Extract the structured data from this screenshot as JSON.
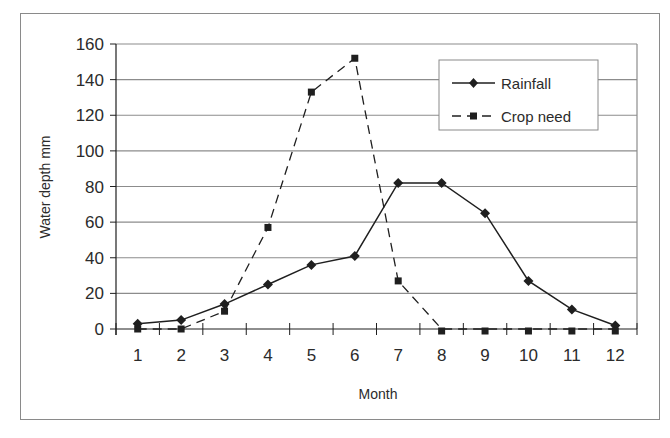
{
  "chart_data": {
    "type": "line",
    "title": "",
    "xlabel": "Month",
    "ylabel": "Water depth mm",
    "categories": [
      "1",
      "2",
      "3",
      "4",
      "5",
      "6",
      "7",
      "8",
      "9",
      "10",
      "11",
      "12"
    ],
    "ylim": [
      0,
      160
    ],
    "yticks": [
      0,
      20,
      40,
      60,
      80,
      100,
      120,
      140,
      160
    ],
    "grid": true,
    "legend_position": "upper right (inside plot)",
    "series": [
      {
        "name": "Rainfall",
        "style": "solid line, diamond markers",
        "values": [
          3,
          5,
          14,
          25,
          36,
          41,
          82,
          82,
          65,
          27,
          11,
          2
        ]
      },
      {
        "name": "Crop need",
        "style": "dashed line, square markers",
        "values": [
          0,
          0,
          10,
          57,
          133,
          152,
          27,
          0,
          0,
          0,
          0,
          0
        ]
      }
    ]
  },
  "colors": {
    "line": "#1f1f1f",
    "grid": "#8c8c8c",
    "frame": "#8a8a8a",
    "text": "#2b2b2b"
  }
}
